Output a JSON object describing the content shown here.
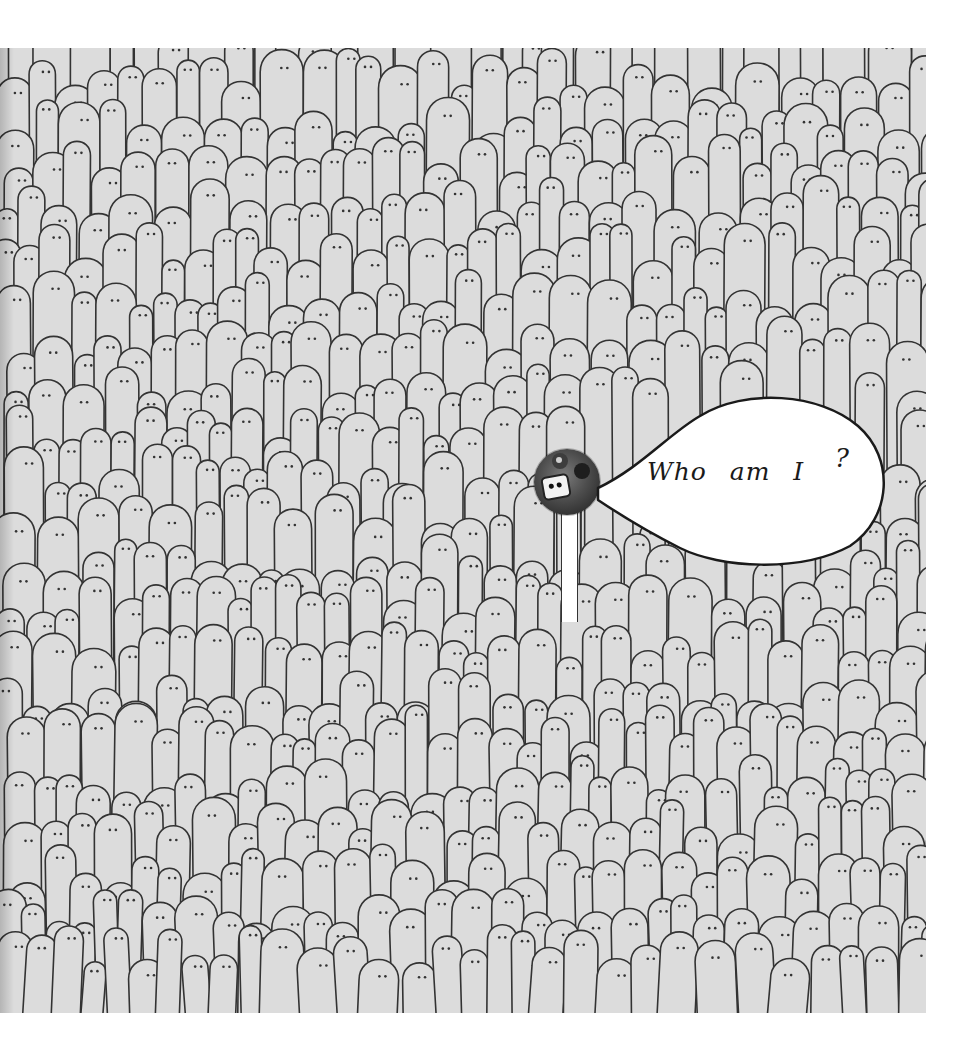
{
  "illustration": {
    "description": "Hand-drawn crowd of tall ghost-like figures with dot eyes; one photographic figure with a speech bubble",
    "colors": {
      "page_background": "#ffffff",
      "drawing_background": "#dcdcdc",
      "line_color": "#333333",
      "bubble_fill": "#ffffff"
    }
  },
  "speech_bubble": {
    "text": "Who am I",
    "question_mark": "?"
  },
  "character": {
    "icon": "photo-figure-icon"
  }
}
